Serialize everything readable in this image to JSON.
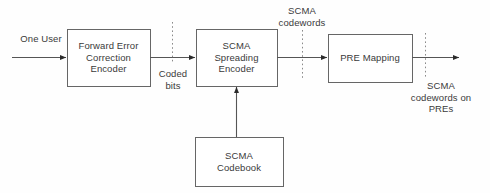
{
  "diagram": {
    "background_color": "#fefefe",
    "line_color": "#555555",
    "text_color": "#3a3a3a",
    "blocks": [
      {
        "id": "fec",
        "label": "Forward Error\nCorrection\nEncoder",
        "x": 67,
        "y": 29,
        "w": 83,
        "h": 57
      },
      {
        "id": "spread",
        "label": "SCMA\nSpreading\nEncoder",
        "x": 196,
        "y": 29,
        "w": 81,
        "h": 57
      },
      {
        "id": "pre",
        "label": "PRE Mapping",
        "x": 328,
        "y": 34,
        "w": 84,
        "h": 48
      },
      {
        "id": "codebook",
        "label": "SCMA\nCodebook",
        "x": 195,
        "y": 137,
        "w": 88,
        "h": 49
      }
    ],
    "labels": [
      {
        "id": "one-user",
        "text": "One User",
        "x": 10,
        "y": 33
      },
      {
        "id": "coded-bits",
        "text": "Coded\nbits",
        "x": 150,
        "y": 68
      },
      {
        "id": "scma-cw",
        "text": "SCMA\ncodewords",
        "x": 264,
        "y": 5
      },
      {
        "id": "scma-cw-pre",
        "text": "SCMA\ncodewords on\nPREs",
        "x": 395,
        "y": 80
      }
    ],
    "connectors": [
      {
        "id": "in-to-fec",
        "from": "input",
        "to": "fec",
        "orientation": "horizontal",
        "arrow": true
      },
      {
        "id": "fec-to-spread",
        "from": "fec",
        "to": "spread",
        "orientation": "horizontal",
        "arrow": true
      },
      {
        "id": "spread-to-pre",
        "from": "spread",
        "to": "pre",
        "orientation": "horizontal",
        "arrow": true
      },
      {
        "id": "pre-to-out",
        "from": "pre",
        "to": "output",
        "orientation": "horizontal",
        "arrow": true
      },
      {
        "id": "codebook-to-spread",
        "from": "codebook",
        "to": "spread",
        "orientation": "vertical",
        "arrow": true
      }
    ],
    "cut_markers": [
      {
        "id": "cut-coded-bits",
        "x": 172,
        "y1": 22,
        "y2": 63
      },
      {
        "id": "cut-scma-cw",
        "x": 302,
        "y1": 30,
        "y2": 78
      },
      {
        "id": "cut-scma-cw-pre",
        "x": 425,
        "y1": 33,
        "y2": 79
      }
    ]
  }
}
